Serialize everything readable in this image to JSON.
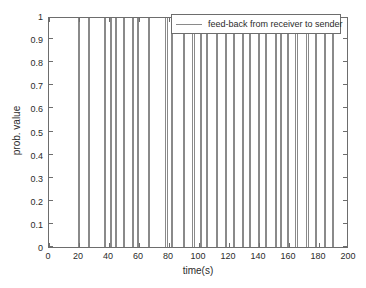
{
  "chart_data": {
    "type": "line",
    "title": "",
    "xlabel": "time(s)",
    "ylabel": "prob. value",
    "xlim": [
      0,
      200
    ],
    "ylim": [
      0,
      1
    ],
    "grid": false,
    "legend_position": "top-right",
    "xticks": [
      0,
      20,
      40,
      60,
      80,
      100,
      120,
      140,
      160,
      180,
      200
    ],
    "xtick_labels": [
      "0",
      "20",
      "40",
      "60",
      "80",
      "100",
      "120",
      "140",
      "160",
      "180",
      "200"
    ],
    "yticks": [
      0,
      0.1,
      0.2,
      0.3,
      0.4,
      0.5,
      0.6,
      0.7,
      0.8,
      0.9,
      1
    ],
    "ytick_labels": [
      "0",
      "0.1",
      "0.2",
      "0.3",
      "0.4",
      "0.5",
      "0.6",
      "0.7",
      "0.8",
      "0.9",
      "1"
    ],
    "series": [
      {
        "name": "feed-back from receiver to sender",
        "color": "#8a8a8a",
        "description": "Impulse train: probability value is 0 everywhere except at discrete feed-back event times where it reaches 1.",
        "baseline": 0,
        "peak": 1,
        "impulse_times": [
          19.5,
          20.3,
          25.8,
          26.6,
          36.4,
          37.2,
          40.6,
          41.4,
          44.0,
          44.8,
          49.2,
          50.0,
          55.4,
          56.2,
          58.5,
          59.3,
          65.8,
          66.6,
          77.6,
          78.4,
          81.0,
          81.8,
          89.4,
          90.2,
          95.6,
          96.4,
          100.4,
          101.2,
          104.8,
          105.6,
          111.2,
          112.0,
          117.5,
          118.3,
          122.8,
          123.6,
          128.5,
          129.3,
          133.0,
          133.8,
          139.4,
          140.2,
          144.0,
          144.8,
          150.6,
          151.4,
          154.0,
          154.8,
          158.8,
          159.6,
          164.2,
          165.0,
          171.6,
          172.4,
          177.5,
          178.3,
          183.0,
          183.8,
          188.6,
          189.4
        ]
      }
    ]
  },
  "axes": {
    "xlabel": "time(s)",
    "ylabel": "prob. value"
  },
  "legend": {
    "entries": [
      {
        "label": "feed-back from receiver to sender",
        "color": "#8a8a8a"
      }
    ]
  },
  "colors": {
    "series": "#8a8a8a",
    "axis": "#6d6d6d",
    "text": "#2b2b2b",
    "background": "#ffffff"
  }
}
